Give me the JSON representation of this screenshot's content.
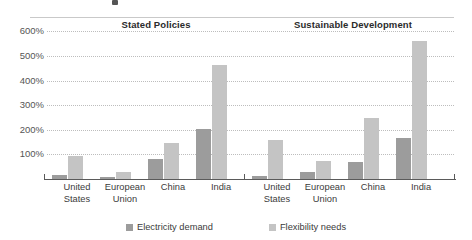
{
  "chart_data": {
    "type": "bar",
    "title": "",
    "panels": [
      {
        "name": "Stated Policies",
        "categories": [
          "United\nStates",
          "European\nUnion",
          "China",
          "India"
        ],
        "series": [
          {
            "name": "Electricity demand",
            "values": [
              15,
              8,
              80,
              205
            ],
            "color": "#9c9c9c"
          },
          {
            "name": "Flexibility needs",
            "values": [
              95,
              30,
              145,
              465
            ],
            "color": "#c4c4c4"
          }
        ]
      },
      {
        "name": "Sustainable Development",
        "categories": [
          "United\nStates",
          "European\nUnion",
          "China",
          "India"
        ],
        "series": [
          {
            "name": "Electricity demand",
            "values": [
              12,
              30,
              70,
              165
            ],
            "color": "#9c9c9c"
          },
          {
            "name": "Flexibility needs",
            "values": [
              160,
              75,
              250,
              560
            ],
            "color": "#c4c4c4"
          }
        ]
      }
    ],
    "ytick_labels": [
      "600%",
      "500%",
      "400%",
      "300%",
      "200%",
      "100%"
    ],
    "ytick_values": [
      600,
      500,
      400,
      300,
      200,
      100
    ],
    "ylim": [
      0,
      600
    ],
    "xlabel": "",
    "ylabel": "",
    "grid": true,
    "legend_position": "bottom",
    "legend": [
      {
        "label": "Electricity demand",
        "color": "#9c9c9c"
      },
      {
        "label": "Flexibility needs",
        "color": "#c4c4c4"
      }
    ]
  },
  "panel_titles": {
    "stated": "Stated Policies",
    "sustainable": "Sustainable Development"
  }
}
